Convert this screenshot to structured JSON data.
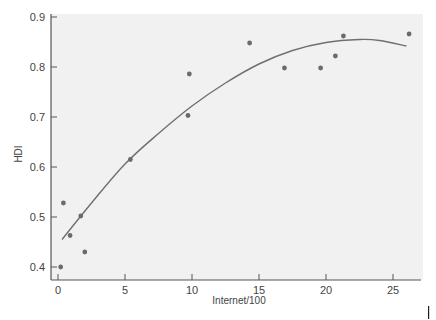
{
  "chart_data": {
    "type": "scatter",
    "title": "",
    "xlabel": "Internet/100",
    "ylabel": "HDI",
    "xlim": [
      -0.5,
      27
    ],
    "ylim": [
      0.39,
      0.905
    ],
    "xticks": [
      0,
      5,
      10,
      15,
      20,
      25
    ],
    "yticks": [
      0.4,
      0.5,
      0.6,
      0.7,
      0.8,
      0.9
    ],
    "grid": false,
    "legend": null,
    "series": [
      {
        "name": "countries",
        "kind": "scatter",
        "points": [
          {
            "x": 0.2,
            "y": 0.4
          },
          {
            "x": 0.4,
            "y": 0.528
          },
          {
            "x": 0.9,
            "y": 0.463
          },
          {
            "x": 1.7,
            "y": 0.502
          },
          {
            "x": 2.0,
            "y": 0.43
          },
          {
            "x": 5.4,
            "y": 0.615
          },
          {
            "x": 9.7,
            "y": 0.703
          },
          {
            "x": 9.8,
            "y": 0.786
          },
          {
            "x": 14.3,
            "y": 0.848
          },
          {
            "x": 16.9,
            "y": 0.798
          },
          {
            "x": 19.6,
            "y": 0.798
          },
          {
            "x": 20.7,
            "y": 0.822
          },
          {
            "x": 21.3,
            "y": 0.862
          },
          {
            "x": 26.2,
            "y": 0.866
          }
        ]
      },
      {
        "name": "quadratic fit",
        "kind": "line",
        "points": [
          {
            "x": 0.3,
            "y": 0.455
          },
          {
            "x": 2.5,
            "y": 0.528
          },
          {
            "x": 5.0,
            "y": 0.606
          },
          {
            "x": 7.5,
            "y": 0.667
          },
          {
            "x": 10.0,
            "y": 0.722
          },
          {
            "x": 12.5,
            "y": 0.768
          },
          {
            "x": 15.0,
            "y": 0.806
          },
          {
            "x": 17.5,
            "y": 0.833
          },
          {
            "x": 20.0,
            "y": 0.849
          },
          {
            "x": 22.5,
            "y": 0.855
          },
          {
            "x": 24.0,
            "y": 0.853
          },
          {
            "x": 26.0,
            "y": 0.842
          }
        ]
      }
    ],
    "colors": {
      "points": "#6b6b6b",
      "line": "#6f6f6f",
      "plot_bg": "#f1f1f1",
      "axis": "#555555"
    }
  }
}
